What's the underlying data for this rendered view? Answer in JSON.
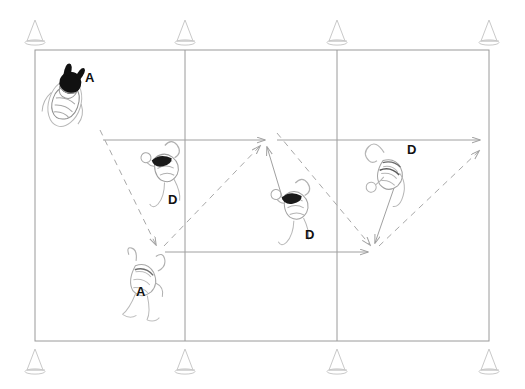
{
  "diagram": {
    "type": "court-drill",
    "background_color": "#ffffff",
    "court": {
      "line_color": "#9a9a9a",
      "outline": {
        "x": 35,
        "y": 50,
        "width": 454,
        "height": 291
      },
      "vertical_lines_x": [
        185,
        337
      ],
      "horizontal_lines_y": [
        140,
        252
      ]
    },
    "cones": {
      "color": "#cccccc",
      "label": "cone",
      "top_row_y": 34,
      "bottom_row_y": 358,
      "positions_x": [
        35,
        185,
        337,
        489
      ]
    },
    "legend": {
      "attacker_code": "A",
      "defender_code": "D",
      "solid_line_meaning": "player movement",
      "dashed_line_meaning": "ball path"
    },
    "players": [
      {
        "id": "p1",
        "role_label": "A",
        "label_x": 85,
        "label_y": 71,
        "fig_x": 55,
        "fig_y": 68,
        "highlight": true,
        "note": "attacker top-left, dark hair"
      },
      {
        "id": "p2",
        "role_label": "D",
        "label_x": 168,
        "label_y": 193,
        "fig_x": 140,
        "fig_y": 142,
        "highlight": false,
        "note": "defender left-center"
      },
      {
        "id": "p3",
        "role_label": "A",
        "label_x": 136,
        "label_y": 285,
        "fig_x": 133,
        "fig_y": 248,
        "highlight": false,
        "note": "attacker lower-left"
      },
      {
        "id": "p4",
        "role_label": "D",
        "label_x": 305,
        "label_y": 228,
        "fig_x": 272,
        "fig_y": 180,
        "highlight": false,
        "note": "defender center"
      },
      {
        "id": "p5",
        "role_label": "D",
        "label_x": 407,
        "label_y": 143,
        "fig_x": 373,
        "fig_y": 140,
        "highlight": false,
        "note": "defender right"
      }
    ],
    "solid_arrows": [
      {
        "name": "movement-top-to-center",
        "from": [
          103,
          140
        ],
        "to": [
          265,
          140
        ]
      },
      {
        "name": "movement-center-to-right-edge",
        "from": [
          277,
          140
        ],
        "to": [
          480,
          140
        ]
      },
      {
        "name": "movement-center-player-up",
        "from": [
          283,
          198
        ],
        "to": [
          267,
          146
        ]
      },
      {
        "name": "movement-lowleft-to-right",
        "from": [
          165,
          252
        ],
        "to": [
          368,
          252
        ]
      },
      {
        "name": "movement-right-player-down",
        "from": [
          394,
          188
        ],
        "to": [
          374,
          243
        ]
      }
    ],
    "dashed_arrows": [
      {
        "name": "ball-topleft-to-lowerleft",
        "from": [
          100,
          130
        ],
        "to": [
          156,
          246
        ]
      },
      {
        "name": "ball-lowerleft-to-center",
        "from": [
          163,
          246
        ],
        "to": [
          260,
          145
        ]
      },
      {
        "name": "ball-center-to-lowright",
        "from": [
          276,
          133
        ],
        "to": [
          370,
          245
        ]
      },
      {
        "name": "ball-lowright-to-upright",
        "from": [
          378,
          246
        ],
        "to": [
          479,
          150
        ]
      }
    ]
  }
}
